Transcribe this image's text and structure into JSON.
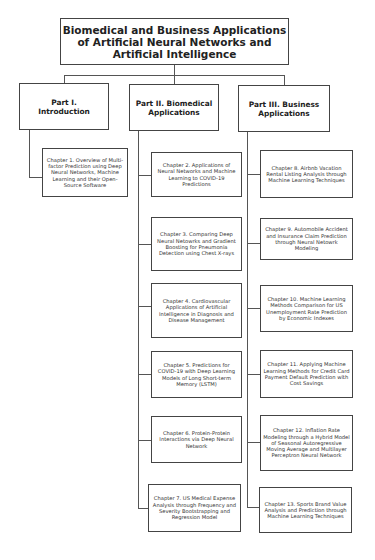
{
  "diagram": {
    "title": "Biomedical and Business Applications of Artificial Neural Networks and Artificial Intelligence",
    "parts": [
      {
        "label": "Part I. Introduction",
        "chapters": [
          "Chapter 1. Overview of Multi-factor Prediction using Deep Neural Networks, Machine Learning and their Open-Source Software"
        ]
      },
      {
        "label": "Part II. Biomedical Applications",
        "chapters": [
          "Chapter 2. Applications of Neural Networks and Machine Learning to COVID-19 Predictions",
          "Chapter 3. Comparing Deep Neural Netowrks and Gradient Boosting for Pneumonia Detection using Chest X-rays",
          "Chapter 4. Cardiovascular Applications of Artificial Intelligence in Diagnosis and Disease Management",
          "Chapter 5. Predictions for COVID-19 with Deep Learning Models of Long Short-term Memory (LSTM)",
          "Chapter 6. Protein-Protein Interactions via Deep Neural Network",
          "Chapter 7. US Medical Expense Analysis through Frequency and Severity Bootstrapping and Regression Model"
        ]
      },
      {
        "label": "Part III. Business Applications",
        "chapters": [
          "Chapter 8. Airbnb Vacation Rental Listing Analysis through Machine Learning Techniques",
          "Chapter 9. Automobile Accident and Insurance Claim Prediction through Neural Netowrk Modeling",
          "Chapter 10. Machine Learning Methods Comparison for US Unemployment Rate Prediction by Economic Indexes",
          "Chapter 11. Applying Machine Learning Methods for Credit Card Payment Default Prediction with Cost Savings",
          "Chapter 12. Inflation Rate Modeling through a Hybrid Model of Seasonal Autoregressive Moving Average and Multilayer Perceptron Neural Network",
          "Chapter 13. Sports Brand Value Analysis and Prediction through Machine Learning Techniques"
        ]
      }
    ]
  }
}
